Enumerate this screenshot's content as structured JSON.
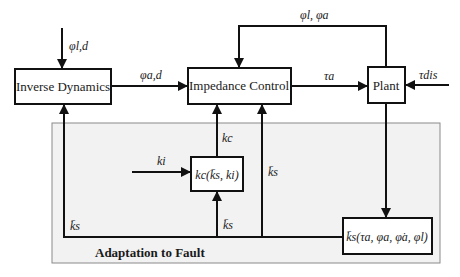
{
  "diagram": {
    "blocks": {
      "inverse_dynamics": "Inverse Dynamics",
      "impedance_control": "Impedance Control",
      "plant": "Plant",
      "kc_block": "kc(k̄s, ki)",
      "ks_block": "k̄s(τa, φa, φ̇a, φl)"
    },
    "signals": {
      "phi_l_d": "φl,d",
      "phi_a_d": "φa,d",
      "tau_a": "τa",
      "tau_dis": "τdis",
      "feedback": "φl, φa",
      "k_c": "kc",
      "k_i": "ki",
      "ks_bar_left": "k̄s",
      "ks_bar_mid": "k̄s",
      "ks_bar_right": "k̄s"
    },
    "panel": {
      "label": "Adaptation to Fault",
      "fill": "#f2f2f2",
      "border": "#8a8a8a"
    }
  }
}
